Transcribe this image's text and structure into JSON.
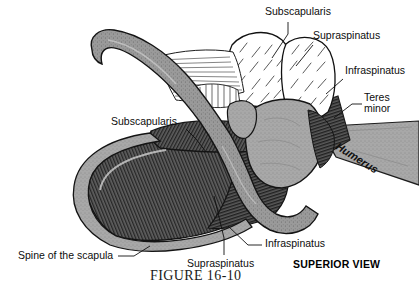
{
  "figure": {
    "caption": "FIGURE 16-10",
    "view_note": "SUPERIOR VIEW",
    "bone_label": "Humerus"
  },
  "labels": {
    "top_subscapularis": "Subscapularis",
    "top_supraspinatus": "Supraspinatus",
    "right_infraspinatus": "Infraspinatus",
    "right_teres_line1": "Teres",
    "right_teres_line2": "minor",
    "left_subscapularis": "Subscapularis",
    "bottom_infraspinatus": "Infraspinatus",
    "bottom_supraspinatus": "Supraspinatus",
    "bottom_spine": "Spine of the scapula"
  },
  "colors": {
    "bone_gray": "#a8a8a8",
    "bone_outline": "#1c1c1c",
    "muscle_dark": "#555555",
    "muscle_stripe": "#262626",
    "muscle_white": "#ffffff",
    "background": "#ffffff",
    "text": "#0d0d0d"
  }
}
